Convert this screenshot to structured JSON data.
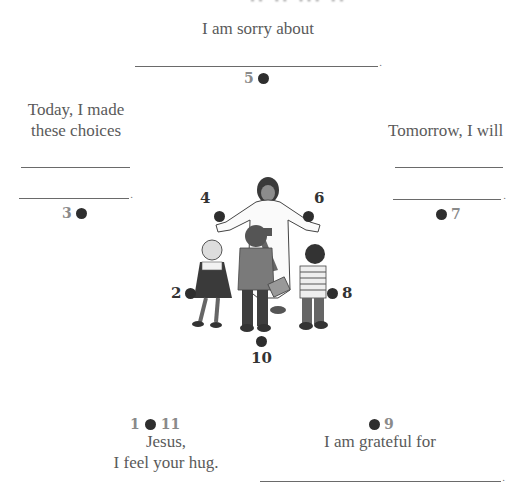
{
  "top_cropped_text": "·· ·· ··· ··",
  "prompts": {
    "sorry": "I am sorry about",
    "today_line1": "Today, I made",
    "today_line2": "these choices",
    "tomorrow": "Tomorrow, I will",
    "jesus_line1": "Jesus,",
    "jesus_line2": "I feel your hug.",
    "grateful": "I am grateful for"
  },
  "markers": {
    "m1": "1",
    "m2": "2",
    "m3": "3",
    "m4": "4",
    "m5": "5",
    "m6": "6",
    "m7": "7",
    "m8": "8",
    "m9": "9",
    "m10": "10",
    "m11": "11"
  },
  "punctuation": {
    "period": "."
  },
  "illustration": {
    "label": "Jesus with open arms welcoming three children"
  },
  "colors": {
    "dot": "#2e2e2e",
    "number": "#8a8a8a",
    "number_dark": "#333333",
    "text": "#5a5a5a",
    "line": "#6a6a6a"
  }
}
